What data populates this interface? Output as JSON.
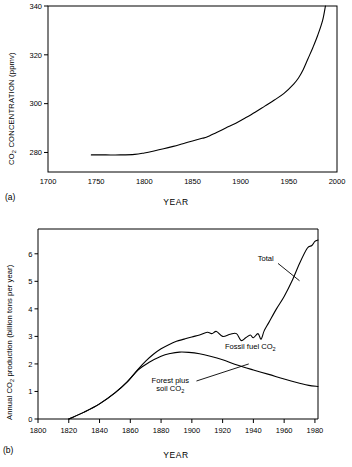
{
  "figure": {
    "panels": [
      {
        "letter": "(a)",
        "xlabel": "YEAR",
        "ylabel_main": "CO",
        "ylabel_sub": "2",
        "ylabel_rest": " CONCENTRATION (ppmv)"
      },
      {
        "letter": "(b)",
        "xlabel": "YEAR",
        "ylabel_pre": "Annual  CO",
        "ylabel_sub": "2",
        "ylabel_post": " production  (billion tons per year)"
      }
    ]
  },
  "chart_data": [
    {
      "type": "line",
      "title": "",
      "xlabel": "YEAR",
      "ylabel": "CO2 CONCENTRATION (ppmv)",
      "xlim": [
        1700,
        2000
      ],
      "ylim": [
        272,
        340
      ],
      "xticks": [
        1700,
        1750,
        1800,
        1850,
        1900,
        1950,
        2000
      ],
      "yticks": [
        280,
        300,
        320,
        340
      ],
      "grid": false,
      "legend": "none",
      "series": [
        {
          "name": "CO2 concentration",
          "x": [
            1745,
            1760,
            1775,
            1790,
            1800,
            1810,
            1820,
            1830,
            1840,
            1850,
            1860,
            1865,
            1875,
            1885,
            1895,
            1905,
            1915,
            1925,
            1935,
            1945,
            1955,
            1960,
            1965,
            1970,
            1975,
            1980,
            1985,
            1988
          ],
          "y": [
            279.0,
            279.0,
            279.0,
            279.2,
            279.8,
            280.6,
            281.5,
            282.5,
            283.6,
            284.7,
            285.8,
            286.3,
            288.2,
            290.1,
            292.0,
            294.2,
            296.5,
            299.0,
            301.5,
            304.2,
            308.0,
            310.5,
            314.0,
            318.5,
            323.0,
            328.0,
            334.0,
            340.0
          ]
        }
      ]
    },
    {
      "type": "line",
      "title": "",
      "xlabel": "YEAR",
      "ylabel": "Annual CO2 production (billion tons per year)",
      "xlim": [
        1800,
        1982
      ],
      "ylim": [
        0,
        6.9
      ],
      "xticks": [
        1800,
        1820,
        1840,
        1860,
        1880,
        1900,
        1920,
        1940,
        1960,
        1980
      ],
      "yticks": [
        0,
        1,
        2,
        3,
        4,
        5,
        6
      ],
      "grid": false,
      "legend": "inline-annotations",
      "annotations": [
        {
          "label": "Total",
          "x": 1948,
          "y": 5.75
        },
        {
          "label": "Fossil fuel CO2",
          "x": 1938,
          "y": 2.55
        },
        {
          "label": "Forest plus",
          "x": 1886,
          "y": 1.3
        },
        {
          "label": "soil CO2",
          "x": 1886,
          "y": 1.0
        }
      ],
      "series": [
        {
          "name": "Total",
          "x": [
            1820,
            1830,
            1840,
            1850,
            1858,
            1865,
            1870,
            1875,
            1880,
            1885,
            1890,
            1895,
            1900,
            1905,
            1910,
            1913,
            1916,
            1920,
            1925,
            1929,
            1932,
            1935,
            1938,
            1940,
            1943,
            1945,
            1947,
            1950,
            1955,
            1960,
            1965,
            1970,
            1975,
            1978,
            1980,
            1982
          ],
          "y": [
            0.0,
            0.25,
            0.55,
            0.95,
            1.35,
            1.8,
            2.1,
            2.35,
            2.55,
            2.7,
            2.82,
            2.9,
            2.98,
            3.05,
            3.15,
            3.1,
            3.18,
            3.0,
            3.08,
            3.1,
            2.85,
            2.95,
            3.05,
            2.95,
            3.1,
            2.9,
            3.2,
            3.5,
            4.0,
            4.45,
            5.0,
            5.65,
            6.2,
            6.3,
            6.45,
            6.5
          ]
        },
        {
          "name": "Forest plus soil CO2",
          "x": [
            1820,
            1830,
            1840,
            1850,
            1858,
            1865,
            1872,
            1880,
            1886,
            1892,
            1898,
            1905,
            1912,
            1920,
            1930,
            1940,
            1950,
            1960,
            1970,
            1976,
            1982
          ],
          "y": [
            0.0,
            0.25,
            0.55,
            0.95,
            1.35,
            1.78,
            2.05,
            2.28,
            2.38,
            2.43,
            2.42,
            2.37,
            2.28,
            2.15,
            1.95,
            1.78,
            1.62,
            1.45,
            1.3,
            1.22,
            1.18
          ]
        }
      ]
    }
  ]
}
